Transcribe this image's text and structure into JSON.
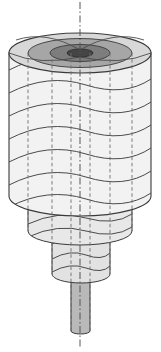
{
  "figure": {
    "canvas": {
      "width": 161,
      "height": 352,
      "background": "#ffffff"
    }
  },
  "colors": {
    "outline": "#3a3a3a",
    "helix_line": "#4a4a4a",
    "hidden_dash": "#6e6e6e",
    "center_line": "#555555",
    "body_fill": "#f2f2f2",
    "body_fill_alt": "#e8e8e8",
    "step_fill": "#e2e2e2",
    "shaft_fill": "#b9b9b9",
    "ring_outer": "#d8d8d8",
    "ring_mid": "#a6a6a6",
    "ring_inner": "#7d7d7d",
    "ring_core": "#454545",
    "top_face": "#cfcfcf"
  },
  "axis": {
    "name": "center-axis",
    "x": 80,
    "y_top": 2,
    "y_bottom": 349,
    "style": "dash-dot",
    "width": 1
  },
  "top_face": {
    "center_x": 80,
    "center_y": 53,
    "rings": [
      {
        "label": "outer-rim",
        "rx": 71,
        "ry": 20,
        "fill": "#d8d8d8"
      },
      {
        "label": "ring-2",
        "rx": 52,
        "ry": 14.5,
        "fill": "#a6a6a6"
      },
      {
        "label": "ring-3",
        "rx": 30,
        "ry": 8.5,
        "fill": "#7d7d7d"
      },
      {
        "label": "hub-core",
        "rx": 13,
        "ry": 4.0,
        "fill": "#454545"
      }
    ]
  },
  "stages": [
    {
      "name": "stage-1-main-barrel",
      "left": 9,
      "right": 151,
      "top_y": 53,
      "bottom_y": 196,
      "rx": 71,
      "ry": 20,
      "fill": "#f2f2f2",
      "helix_turns": 6
    },
    {
      "name": "stage-2",
      "left": 28,
      "right": 132,
      "top_y": 196,
      "bottom_y": 231,
      "rx": 52,
      "ry": 14,
      "fill": "#e8e8e8",
      "helix_turns": 3
    },
    {
      "name": "stage-3",
      "left": 52,
      "right": 110,
      "top_y": 231,
      "bottom_y": 274,
      "rx": 29,
      "ry": 9,
      "fill": "#e2e2e2",
      "helix_turns": 3
    },
    {
      "name": "stage-4-shaft",
      "left": 71,
      "right": 90,
      "top_y": 274,
      "bottom_y": 331,
      "rx": 9.5,
      "ry": 3,
      "fill": "#b9b9b9",
      "helix_turns": 0
    }
  ],
  "hidden_lines": {
    "name": "hidden-vertical-edges",
    "style": "dashed",
    "x_positions": [
      28,
      52,
      71,
      90,
      110,
      132
    ],
    "y_top": 53,
    "y_bottom_map": {
      "28": 231,
      "52": 274,
      "71": 331,
      "90": 331,
      "110": 274,
      "132": 231
    }
  },
  "helix_left_crossings_y": [
    70,
    93,
    116,
    139,
    162,
    185
  ],
  "labels": {
    "none_visible": ""
  }
}
